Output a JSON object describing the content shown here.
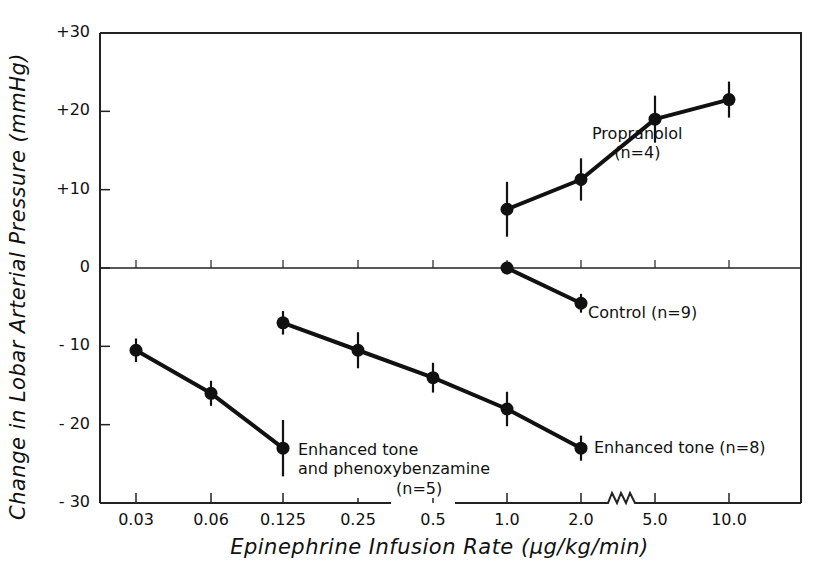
{
  "chart_data": {
    "type": "line",
    "title": "",
    "xlabel": "Epinephrine Infusion Rate (µg/kg/min)",
    "ylabel": "Change in Lobar Arterial Pressure (mmHg)",
    "ylim": [
      -30,
      30
    ],
    "grid": false,
    "y_ticks": [
      "+30",
      "+20",
      "+10",
      "0",
      "- 10",
      "- 20",
      "- 30"
    ],
    "y_tick_values": [
      30,
      20,
      10,
      0,
      -10,
      -20,
      -30
    ],
    "categories": [
      "0.03",
      "0.06",
      "0.125",
      "0.25",
      "0.5",
      "1.0",
      "2.0",
      "5.0",
      "10.0"
    ],
    "axis_break": "between 2.0 and 5.0",
    "series": [
      {
        "name": "Propranolol",
        "n_label": "(n=4)",
        "x": [
          "1.0",
          "2.0",
          "5.0",
          "10.0"
        ],
        "values": [
          7.5,
          11.3,
          19,
          21.5
        ],
        "error": [
          3.5,
          2.7,
          3.0,
          2.3
        ]
      },
      {
        "name": "Control",
        "n_label": "(n=9)",
        "x": [
          "1.0",
          "2.0"
        ],
        "values": [
          0,
          -4.5
        ],
        "error": [
          0.8,
          1.2
        ]
      },
      {
        "name": "Enhanced tone",
        "n_label": "(n=8)",
        "x": [
          "0.125",
          "0.25",
          "0.5",
          "1.0",
          "2.0"
        ],
        "values": [
          -7,
          -10.5,
          -14,
          -18,
          -23
        ],
        "error": [
          1.5,
          2.3,
          1.9,
          2.2,
          1.6
        ]
      },
      {
        "name": "Enhanced tone and phenoxybenzamine",
        "n_label": "(n=5)",
        "x": [
          "0.03",
          "0.06",
          "0.125"
        ],
        "values": [
          -10.5,
          -16,
          -23
        ],
        "error": [
          1.5,
          1.6,
          3.6
        ]
      }
    ]
  },
  "labels": {
    "propranolol_line1": "Propranolol",
    "propranolol_line2": "(n=4)",
    "control": "Control (n=9)",
    "enhanced_tone": "Enhanced tone (n=8)",
    "eta_line1": "Enhanced tone",
    "eta_line2": "and phenoxybenzamine",
    "eta_line3": "(n=5)"
  }
}
